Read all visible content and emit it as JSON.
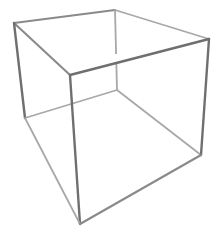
{
  "figure": {
    "type": "wireframe-cube",
    "background": "#ffffff",
    "stroke_color_front": "#6f6f6f",
    "stroke_color_mid": "#8a8a8a",
    "stroke_color_back": "#a8a8a8",
    "vertices": {
      "top_left": [
        14,
        23
      ],
      "top_back": [
        115,
        10
      ],
      "top_right": [
        209,
        39
      ],
      "top_front": [
        70,
        75
      ],
      "bottom_left": [
        25,
        118
      ],
      "bottom_back": [
        117,
        90
      ],
      "bottom_right": [
        201,
        155
      ],
      "bottom_front": [
        80,
        224
      ]
    }
  }
}
